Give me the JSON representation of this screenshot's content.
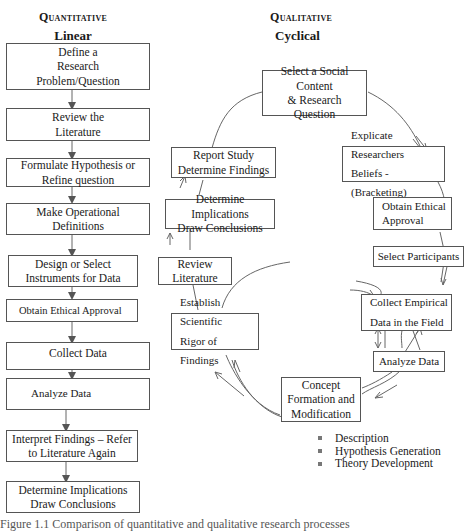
{
  "quantitative": {
    "heading": "Quantitative",
    "subheading": "Linear",
    "steps": [
      "Define a\nResearch\nProblem/Question",
      "Review the\nLiterature",
      "Formulate Hypothesis or\nRefine question",
      "Make Operational\nDefinitions",
      "Design or Select\nInstruments for Data",
      "Obtain Ethical Approval",
      "Collect Data",
      "Analyze Data",
      "Interpret Findings – Refer\nto Literature Again",
      "Determine Implications\nDraw Conclusions"
    ]
  },
  "qualitative": {
    "heading": "Qualitative",
    "subheading": "Cyclical",
    "steps": {
      "select_social": "Select a Social\nContent\n& Research Question",
      "explicate": "Explicate Researchers\nBeliefs - (Bracketing)",
      "ethical": "Obtain Ethical\nApproval",
      "participants": "Select Participants",
      "collect": "Collect Empirical\nData in the Field",
      "analyze": "Analyze Data",
      "concept": "Concept\nFormation and\nModification",
      "rigor": "Establish Scientific\nRigor of Findings",
      "review": "Review\nLiterature",
      "implications": "Determine Implications\nDraw Conclusions",
      "report": "Report Study\nDetermine Findings"
    },
    "outcomes": [
      "Description",
      "Hypothesis Generation",
      "Theory Development"
    ]
  },
  "caption": "Figure 1.1    Comparison of quantitative and qualitative research processes"
}
